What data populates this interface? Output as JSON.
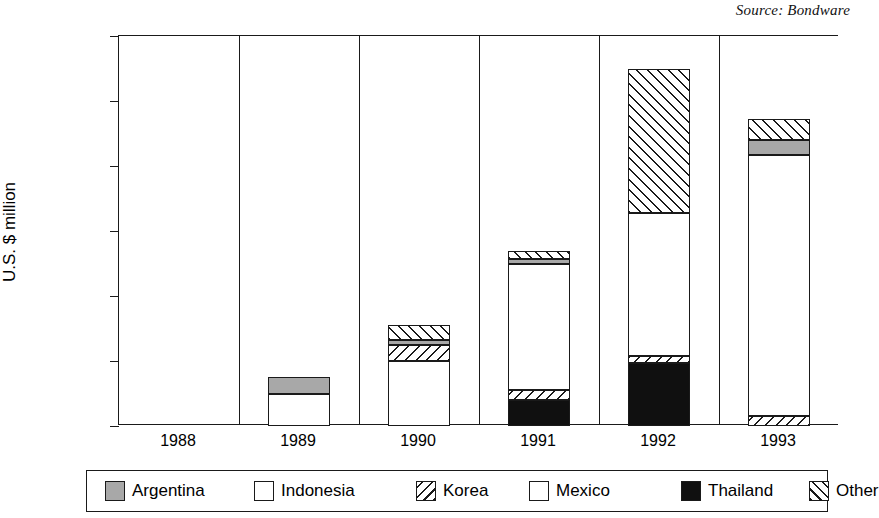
{
  "source_note": "Source: Bondware",
  "chart_data": {
    "type": "bar",
    "subtype": "stacked-bar",
    "title": "",
    "subtitle": "",
    "xlabel": "",
    "ylabel": "U.S. $ million",
    "ylim": [
      0,
      12000
    ],
    "ytick_values": [
      0,
      2000,
      4000,
      6000,
      8000,
      10000,
      12000
    ],
    "ytick_labels": [
      "0",
      "2000",
      "4000",
      "6000",
      "8000",
      "10000",
      "12000"
    ],
    "grid": false,
    "column_separators": true,
    "legend_position": "bottom",
    "categories": [
      "1988",
      "1989",
      "1990",
      "1991",
      "1992",
      "1993"
    ],
    "series": [
      {
        "name": "Argentina",
        "pattern": "solid-gray",
        "color": "#a8a8a8",
        "values": [
          0,
          500,
          150,
          150,
          0,
          450
        ]
      },
      {
        "name": "Indonesia",
        "pattern": "solid-white",
        "color": "#ffffff",
        "values": [
          0,
          0,
          0,
          0,
          0,
          0
        ]
      },
      {
        "name": "Korea",
        "pattern": "hatch-backslash",
        "color": "#ffffff",
        "values": [
          0,
          0,
          500,
          300,
          200,
          300
        ]
      },
      {
        "name": "Mexico",
        "pattern": "solid-white",
        "color": "#ffffff",
        "values": [
          0,
          1000,
          2000,
          3900,
          4400,
          8050
        ]
      },
      {
        "name": "Thailand",
        "pattern": "solid-black",
        "color": "#101010",
        "values": [
          0,
          0,
          0,
          800,
          1950,
          0
        ]
      },
      {
        "name": "Other",
        "pattern": "hatch-slash",
        "color": "#ffffff",
        "values": [
          0,
          0,
          450,
          250,
          4450,
          650
        ]
      }
    ],
    "totals": [
      0,
      1500,
      3100,
      5400,
      11000,
      9450
    ],
    "stacks": [
      {
        "year": "1988",
        "total": 0,
        "segments": []
      },
      {
        "year": "1989",
        "total": 1500,
        "segments": [
          {
            "name": "Mexico",
            "pattern": "solid-white",
            "from": 0,
            "to": 1000
          },
          {
            "name": "Argentina",
            "pattern": "solid-gray",
            "from": 1000,
            "to": 1500
          }
        ]
      },
      {
        "year": "1990",
        "total": 3100,
        "segments": [
          {
            "name": "Mexico",
            "pattern": "solid-white",
            "from": 0,
            "to": 2000
          },
          {
            "name": "Korea",
            "pattern": "hatch-backslash",
            "from": 2000,
            "to": 2500
          },
          {
            "name": "Argentina",
            "pattern": "solid-gray",
            "from": 2500,
            "to": 2650
          },
          {
            "name": "Other",
            "pattern": "hatch-slash",
            "from": 2650,
            "to": 3100
          }
        ]
      },
      {
        "year": "1991",
        "total": 5400,
        "segments": [
          {
            "name": "Thailand",
            "pattern": "solid-black",
            "from": 0,
            "to": 800
          },
          {
            "name": "Korea",
            "pattern": "hatch-backslash",
            "from": 800,
            "to": 1100
          },
          {
            "name": "Mexico",
            "pattern": "solid-white",
            "from": 1100,
            "to": 5000
          },
          {
            "name": "Argentina",
            "pattern": "solid-gray",
            "from": 5000,
            "to": 5150
          },
          {
            "name": "Other",
            "pattern": "hatch-slash",
            "from": 5150,
            "to": 5400
          }
        ]
      },
      {
        "year": "1992",
        "total": 11000,
        "segments": [
          {
            "name": "Thailand",
            "pattern": "solid-black",
            "from": 0,
            "to": 1950
          },
          {
            "name": "Korea",
            "pattern": "hatch-backslash",
            "from": 1950,
            "to": 2150
          },
          {
            "name": "Mexico",
            "pattern": "solid-white",
            "from": 2150,
            "to": 6550
          },
          {
            "name": "Other",
            "pattern": "hatch-slash",
            "from": 6550,
            "to": 11000
          }
        ]
      },
      {
        "year": "1993",
        "total": 9450,
        "segments": [
          {
            "name": "Korea",
            "pattern": "hatch-backslash",
            "from": 0,
            "to": 300
          },
          {
            "name": "Mexico",
            "pattern": "solid-white",
            "from": 300,
            "to": 8350
          },
          {
            "name": "Argentina",
            "pattern": "solid-gray",
            "from": 8350,
            "to": 8800
          },
          {
            "name": "Other",
            "pattern": "hatch-slash",
            "from": 8800,
            "to": 9450
          }
        ]
      }
    ]
  },
  "legend": {
    "items": [
      {
        "label": "Argentina",
        "pattern": "solid-gray"
      },
      {
        "label": "Indonesia",
        "pattern": "solid-white"
      },
      {
        "label": "Korea",
        "pattern": "hatch-backslash"
      },
      {
        "label": "Mexico",
        "pattern": "solid-white"
      },
      {
        "label": "Thailand",
        "pattern": "solid-black"
      },
      {
        "label": "Other",
        "pattern": "hatch-slash"
      }
    ]
  }
}
